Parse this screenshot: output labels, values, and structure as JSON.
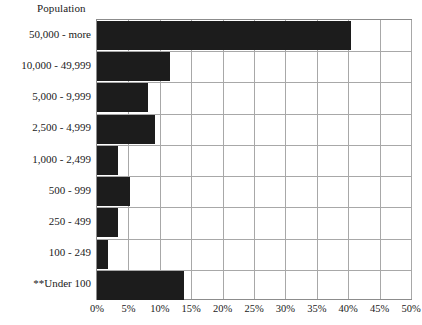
{
  "chart_data": {
    "type": "bar",
    "orientation": "horizontal",
    "title": "Population",
    "xlabel": "",
    "ylabel": "Population",
    "xlim": [
      0,
      50
    ],
    "xticks": [
      0,
      5,
      10,
      15,
      20,
      25,
      30,
      35,
      40,
      45,
      50
    ],
    "xtick_labels": [
      "0%",
      "5%",
      "10%",
      "15%",
      "20%",
      "25%",
      "30%",
      "35%",
      "40%",
      "45%",
      "50%"
    ],
    "grid": true,
    "legend": "none",
    "bar_color": "#1c1c1c",
    "grid_color": "#a8a8a8",
    "border_color": "#8c8c8c",
    "categories": [
      "50,000 - more",
      "10,000 - 49,999",
      "5,000 - 9,999",
      "2,500 - 4,999",
      "1,000 - 2,499",
      "500 - 999",
      "250 - 499",
      "100 - 249",
      "**Under 100"
    ],
    "values": [
      40.5,
      11.7,
      8.2,
      9.3,
      3.3,
      5.2,
      3.3,
      1.8,
      13.8
    ],
    "value_unit": "%"
  }
}
